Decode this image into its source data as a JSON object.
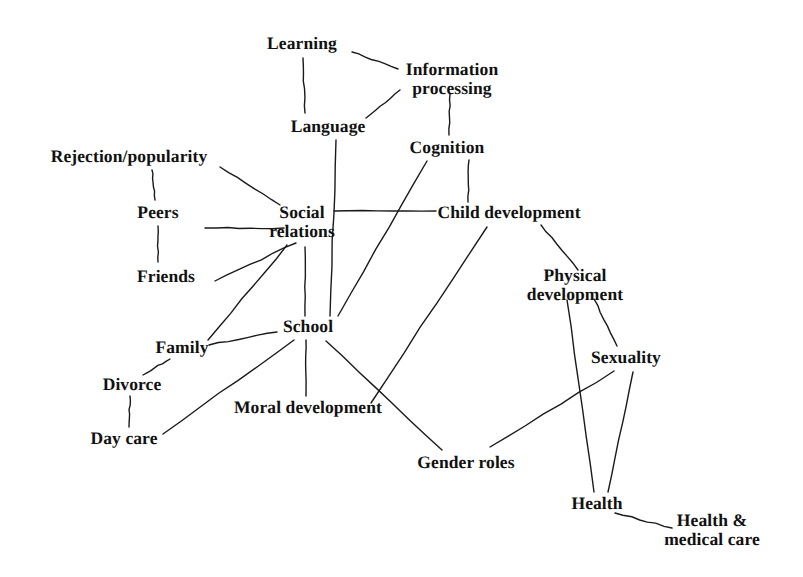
{
  "diagram": {
    "background_color": "#ffffff",
    "line_color": "#1a1a1a",
    "text_color": "#111111",
    "nodes": [
      {
        "id": "learning",
        "label": "Learning",
        "x": 302,
        "y": 44
      },
      {
        "id": "information",
        "label": "Information\nprocessing",
        "x": 452,
        "y": 79
      },
      {
        "id": "language",
        "label": "Language",
        "x": 328,
        "y": 127
      },
      {
        "id": "cognition",
        "label": "Cognition",
        "x": 447,
        "y": 148
      },
      {
        "id": "rejection",
        "label": "Rejection/popularity",
        "x": 129,
        "y": 157
      },
      {
        "id": "social",
        "label": "Social\nrelations",
        "x": 302,
        "y": 222
      },
      {
        "id": "child",
        "label": "Child development",
        "x": 509,
        "y": 213
      },
      {
        "id": "peers",
        "label": "Peers",
        "x": 158,
        "y": 213
      },
      {
        "id": "friends",
        "label": "Friends",
        "x": 166,
        "y": 277
      },
      {
        "id": "physical",
        "label": "Physical\ndevelopment",
        "x": 575,
        "y": 285
      },
      {
        "id": "school",
        "label": "School",
        "x": 308,
        "y": 327
      },
      {
        "id": "family",
        "label": "Family",
        "x": 182,
        "y": 348
      },
      {
        "id": "sexuality",
        "label": "Sexuality",
        "x": 626,
        "y": 358
      },
      {
        "id": "divorce",
        "label": "Divorce",
        "x": 132,
        "y": 385
      },
      {
        "id": "moral",
        "label": "Moral development",
        "x": 308,
        "y": 408
      },
      {
        "id": "daycare",
        "label": "Day care",
        "x": 124,
        "y": 439
      },
      {
        "id": "gender",
        "label": "Gender roles",
        "x": 466,
        "y": 463
      },
      {
        "id": "health",
        "label": "Health",
        "x": 597,
        "y": 504
      },
      {
        "id": "healthcare",
        "label": "Health &\nmedical care",
        "x": 712,
        "y": 530
      }
    ],
    "edges": [
      {
        "from": "learning",
        "to": "information",
        "x1": 352,
        "y1": 52,
        "x2": 398,
        "y2": 69
      },
      {
        "from": "learning",
        "to": "language",
        "x1": 303,
        "y1": 58,
        "x2": 305,
        "y2": 113
      },
      {
        "from": "language",
        "to": "information",
        "x1": 366,
        "y1": 118,
        "x2": 400,
        "y2": 90
      },
      {
        "from": "information",
        "to": "cognition",
        "x1": 450,
        "y1": 94,
        "x2": 449,
        "y2": 135
      },
      {
        "from": "cognition",
        "to": "child",
        "x1": 469,
        "y1": 160,
        "x2": 468,
        "y2": 202
      },
      {
        "from": "rejection",
        "to": "peers",
        "x1": 152,
        "y1": 170,
        "x2": 155,
        "y2": 200
      },
      {
        "from": "peers",
        "to": "friends",
        "x1": 158,
        "y1": 226,
        "x2": 158,
        "y2": 262
      },
      {
        "from": "rejection",
        "to": "social",
        "x1": 220,
        "y1": 167,
        "x2": 280,
        "y2": 205
      },
      {
        "from": "peers",
        "to": "social",
        "x1": 205,
        "y1": 228,
        "x2": 284,
        "y2": 228
      },
      {
        "from": "social",
        "to": "child",
        "x1": 334,
        "y1": 211,
        "x2": 436,
        "y2": 211
      },
      {
        "from": "social",
        "to": "friends",
        "x1": 296,
        "y1": 243,
        "x2": 215,
        "y2": 281
      },
      {
        "from": "social",
        "to": "family",
        "x1": 287,
        "y1": 245,
        "x2": 208,
        "y2": 340
      },
      {
        "from": "social",
        "to": "school",
        "x1": 305,
        "y1": 247,
        "x2": 305,
        "y2": 316
      },
      {
        "from": "language",
        "to": "school",
        "x1": 336,
        "y1": 140,
        "x2": 330,
        "y2": 316
      },
      {
        "from": "cognition",
        "to": "school",
        "x1": 427,
        "y1": 161,
        "x2": 338,
        "y2": 316
      },
      {
        "from": "family",
        "to": "school",
        "x1": 209,
        "y1": 345,
        "x2": 277,
        "y2": 332
      },
      {
        "from": "family",
        "to": "divorce",
        "x1": 170,
        "y1": 359,
        "x2": 143,
        "y2": 375
      },
      {
        "from": "divorce",
        "to": "daycare",
        "x1": 130,
        "y1": 396,
        "x2": 129,
        "y2": 427
      },
      {
        "from": "daycare",
        "to": "school",
        "x1": 163,
        "y1": 434,
        "x2": 294,
        "y2": 340
      },
      {
        "from": "school",
        "to": "moral",
        "x1": 306,
        "y1": 340,
        "x2": 306,
        "y2": 396
      },
      {
        "from": "school",
        "to": "gender",
        "x1": 326,
        "y1": 341,
        "x2": 442,
        "y2": 450
      },
      {
        "from": "child",
        "to": "moral",
        "x1": 487,
        "y1": 227,
        "x2": 371,
        "y2": 403
      },
      {
        "from": "child",
        "to": "physical",
        "x1": 541,
        "y1": 225,
        "x2": 578,
        "y2": 270
      },
      {
        "from": "physical",
        "to": "sexuality",
        "x1": 594,
        "y1": 299,
        "x2": 617,
        "y2": 346
      },
      {
        "from": "physical",
        "to": "health",
        "x1": 567,
        "y1": 300,
        "x2": 594,
        "y2": 492
      },
      {
        "from": "sexuality",
        "to": "gender",
        "x1": 614,
        "y1": 371,
        "x2": 490,
        "y2": 447
      },
      {
        "from": "sexuality",
        "to": "health",
        "x1": 633,
        "y1": 372,
        "x2": 608,
        "y2": 492
      },
      {
        "from": "health",
        "to": "healthcare",
        "x1": 615,
        "y1": 513,
        "x2": 672,
        "y2": 528
      }
    ]
  }
}
